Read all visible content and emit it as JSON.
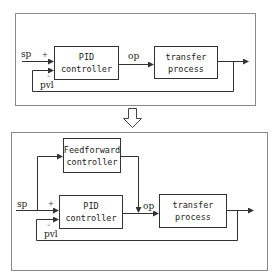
{
  "top_diagram": {
    "title": "PID feedback loop",
    "blocks": {
      "pid": {
        "line1": "PID",
        "line2": "controller"
      },
      "process": {
        "line1": "transfer",
        "line2": "process"
      }
    },
    "labels": {
      "sp": "sp",
      "plus": "+",
      "minus": "–",
      "pvl": "pvl",
      "op": "op"
    }
  },
  "transition_arrow": {
    "icon": "down-arrow-icon"
  },
  "bottom_diagram": {
    "title": "PID with feedforward loop",
    "blocks": {
      "feedforward": {
        "line1": "Feedforward",
        "line2": "controller"
      },
      "pid": {
        "line1": "PID",
        "line2": "controller"
      },
      "process": {
        "line1": "transfer",
        "line2": "process"
      }
    },
    "labels": {
      "sp": "sp",
      "plus": "+",
      "minus": "–",
      "pvl": "pvl",
      "op": "op"
    }
  },
  "colors": {
    "line": "#333333",
    "frame": "#8a8a8a",
    "background": "#ffffff"
  }
}
